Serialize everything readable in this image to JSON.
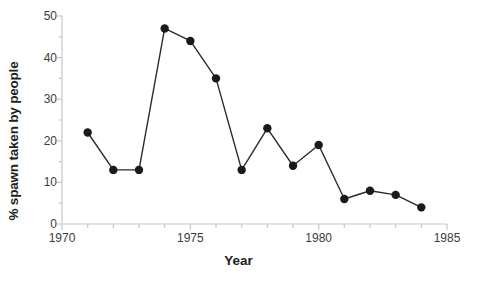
{
  "chart_data": {
    "type": "line",
    "title": "",
    "subtitle": "",
    "xlabel": "Year",
    "ylabel": "% spawn taken by people",
    "xlim": [
      1970,
      1985
    ],
    "ylim": [
      0,
      50
    ],
    "xticks": [
      1970,
      1975,
      1980,
      1985
    ],
    "xtick_labels": [
      "1970",
      "1975",
      "1980",
      "1985"
    ],
    "x_minor_tick_step": 1,
    "yticks": [
      0,
      10,
      20,
      30,
      40,
      50
    ],
    "ytick_labels": [
      "0",
      "10",
      "20",
      "30",
      "40",
      "50"
    ],
    "y_minor_tick_step": 5,
    "grid": false,
    "legend": null,
    "marker": "filled-circle",
    "marker_color": "#1a1a1a",
    "line_color": "#2b2b2b",
    "axis_color": "#c8c8c8",
    "background": "#ffffff",
    "x": [
      1971,
      1972,
      1973,
      1974,
      1975,
      1976,
      1977,
      1978,
      1979,
      1980,
      1981,
      1982,
      1983,
      1984
    ],
    "values": [
      22,
      13,
      13,
      47,
      44,
      35,
      13,
      23,
      14,
      19,
      6,
      8,
      7,
      4
    ],
    "series": [
      {
        "name": "% spawn taken by people",
        "x": [
          1971,
          1972,
          1973,
          1974,
          1975,
          1976,
          1977,
          1978,
          1979,
          1980,
          1981,
          1982,
          1983,
          1984
        ],
        "values": [
          22,
          13,
          13,
          47,
          44,
          35,
          13,
          23,
          14,
          19,
          6,
          8,
          7,
          4
        ]
      }
    ]
  }
}
